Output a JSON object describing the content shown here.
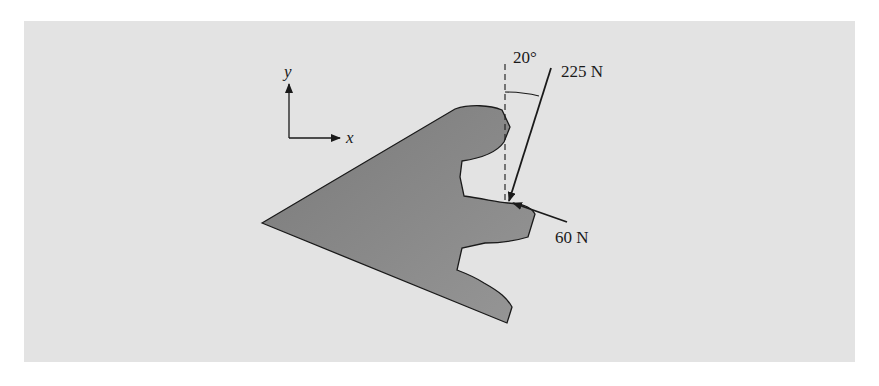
{
  "figure": {
    "axes": {
      "x_label": "x",
      "y_label": "y"
    },
    "forces": [
      {
        "name": "force-225",
        "label": "225 N",
        "angle_label": "20°"
      },
      {
        "name": "force-60",
        "label": "60 N"
      }
    ],
    "colors": {
      "background": "#e3e3e3",
      "body_fill": "#8a8a8a",
      "line": "#1a1a1a"
    }
  }
}
